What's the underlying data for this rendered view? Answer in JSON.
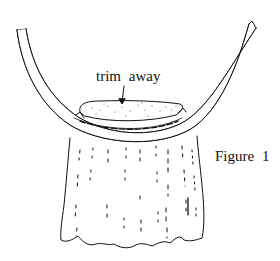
{
  "diagram": {
    "annotation": "trim away",
    "caption": "Figure 1",
    "parts": [
      {
        "name": "curved-band",
        "description": "U-shaped curved strip / bias band"
      },
      {
        "name": "trimmed-area",
        "description": "dotted excess area to trim away"
      },
      {
        "name": "arrow",
        "description": "arrow pointing from label to trimmed area"
      },
      {
        "name": "gathered-fabric",
        "description": "gathered fabric panel with wavy hem"
      }
    ],
    "colors": {
      "ink": "#111111",
      "background": "#ffffff"
    }
  }
}
